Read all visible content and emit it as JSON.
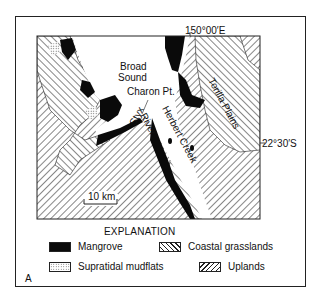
{
  "figure": {
    "panel_letter": "A",
    "coordinates": {
      "longitude_label": "150°00′E",
      "latitude_label": "22°30′S"
    },
    "place_labels": {
      "broad": "Broad",
      "sound": "Sound",
      "charon_pt": "Charon Pt.",
      "styx": "Styx",
      "river": "River",
      "herbert_creek": "Herbert Creek",
      "torilla_plains": "Torilla Plains"
    },
    "scale_bar": {
      "label": "10 km"
    },
    "legend": {
      "title": "EXPLANATION",
      "items": [
        {
          "label": "Mangrove",
          "pattern": "solid-black"
        },
        {
          "label": "Coastal grasslands",
          "pattern": "hatch-backslash"
        },
        {
          "label": "Supratidal mudflats",
          "pattern": "stipple"
        },
        {
          "label": "Uplands",
          "pattern": "hatch-slash"
        }
      ]
    }
  }
}
